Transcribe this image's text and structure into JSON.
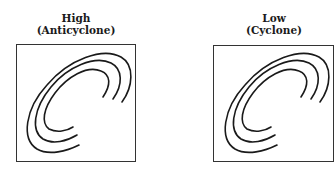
{
  "panels": [
    {
      "id": "high",
      "title": "High",
      "subtitle": "(Anticyclone)"
    },
    {
      "id": "low",
      "title": "Low",
      "subtitle": "(Cyclone)"
    }
  ],
  "colors": {
    "stroke": "#1a1a1a",
    "border": "#333333",
    "background": "#ffffff"
  }
}
